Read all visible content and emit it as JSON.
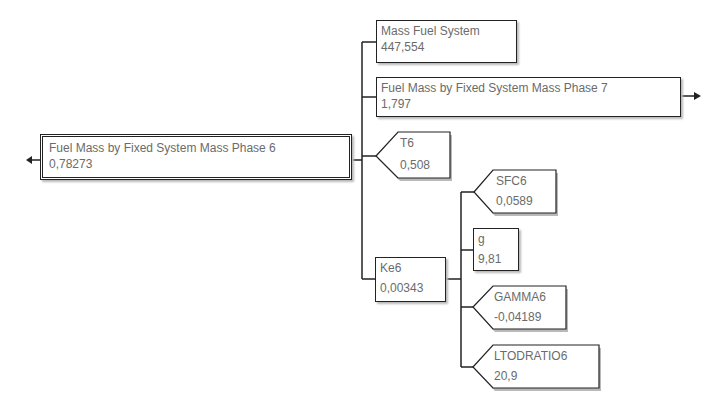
{
  "diagram": {
    "type": "dependency-tree",
    "root": {
      "label": "Fuel Mass by Fixed System Mass Phase 6",
      "value": "0,78273",
      "has_left_arrow": true
    },
    "children": [
      {
        "label": "Mass Fuel System",
        "value": "447,554",
        "shape": "rectangle"
      },
      {
        "label": "Fuel Mass by Fixed System Mass Phase 7",
        "value": "1,797",
        "shape": "rectangle",
        "has_right_arrow": true
      },
      {
        "label": "T6",
        "value": "0,508",
        "shape": "input-pentagon"
      },
      {
        "label": "Ke6",
        "value": "0,00343",
        "shape": "rectangle",
        "children": [
          {
            "label": "SFC6",
            "value": "0,0589",
            "shape": "input-pentagon"
          },
          {
            "label": "g",
            "value": "9,81",
            "shape": "rectangle"
          },
          {
            "label": "GAMMA6",
            "value": "-0,04189",
            "shape": "input-pentagon"
          },
          {
            "label": "LTODRATIO6",
            "value": "20,9",
            "shape": "input-pentagon"
          }
        ]
      }
    ]
  },
  "colors": {
    "line": "#222222",
    "text": "#6b6b6b",
    "shadow": "#b9b9b9",
    "background": "#ffffff"
  }
}
